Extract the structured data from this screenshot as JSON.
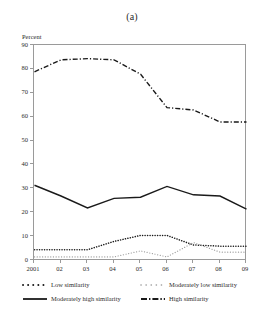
{
  "figure": {
    "panel_title": "(a)",
    "ylabel": "Percent"
  },
  "chart_data": {
    "type": "line",
    "title": "(a)",
    "xlabel": "",
    "ylabel": "Percent",
    "categories": [
      "2001",
      "02",
      "03",
      "04",
      "05",
      "06",
      "07",
      "08",
      "09"
    ],
    "x_tick_labels": [
      "2001",
      "02",
      "03",
      "04",
      "05",
      "06",
      "07",
      "08",
      "09"
    ],
    "y_tick_labels": [
      "0",
      "10",
      "20",
      "30",
      "40",
      "50",
      "60",
      "70",
      "80",
      "90"
    ],
    "y_ticks": [
      0,
      10,
      20,
      30,
      40,
      50,
      60,
      70,
      80,
      90
    ],
    "ylim": [
      0,
      90
    ],
    "grid": false,
    "legend_position": "below-plot",
    "series": [
      {
        "name": "Low similarity",
        "style": "dotted",
        "color": "#1a1a1a",
        "values": [
          4.5,
          4.5,
          4.5,
          8.0,
          10.5,
          10.5,
          6.5,
          6.0,
          6.0
        ]
      },
      {
        "name": "Moderately low similarity",
        "style": "dashed-light",
        "color": "#8d8d8d",
        "values": [
          1.5,
          1.5,
          1.5,
          1.5,
          4.0,
          1.5,
          7.5,
          3.5,
          3.5
        ]
      },
      {
        "name": "Moderately high similarity",
        "style": "solid",
        "color": "#1a1a1a",
        "values": [
          31.5,
          27.0,
          22.0,
          26.0,
          26.5,
          31.0,
          27.5,
          27.0,
          21.5
        ]
      },
      {
        "name": "High similarity",
        "style": "dash-dot",
        "color": "#1a1a1a",
        "values": [
          79.0,
          84.0,
          84.5,
          84.0,
          78.0,
          64.0,
          63.0,
          58.0,
          58.0
        ]
      }
    ]
  },
  "legend": {
    "items": [
      {
        "label": "Low similarity",
        "style": "dotted"
      },
      {
        "label": "Moderately low similarity",
        "style": "dashed-light"
      },
      {
        "label": "Moderately high similarity",
        "style": "solid"
      },
      {
        "label": "High similarity",
        "style": "dash-dot"
      }
    ]
  }
}
